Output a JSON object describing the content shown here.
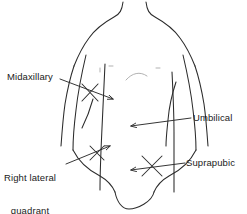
{
  "figure": {
    "background_color": "#ffffff",
    "line_color": "#2b2b2b",
    "faint_line_color": "#9a9a9a"
  },
  "labels": {
    "midaxillary": "Midaxillary",
    "right_lateral_quadrant_line1": "Right lateral",
    "right_lateral_quadrant_line2": "quadrant",
    "umbilical": "Umbilical",
    "suprapubic": "Suprapubic"
  },
  "annotations": [
    {
      "name": "midaxillary",
      "label": "Midaxillary",
      "side": "left",
      "arrow_direction": "right",
      "target": "left mid-axillary line on flank"
    },
    {
      "name": "right-lateral-quadrant",
      "label": "Right lateral quadrant",
      "side": "left",
      "arrow_direction": "up-right",
      "target": "right lower abdominal quadrant"
    },
    {
      "name": "umbilical",
      "label": "Umbilical",
      "side": "right",
      "arrow_direction": "left",
      "target": "umbilicus at abdominal midline"
    },
    {
      "name": "suprapubic",
      "label": "Suprapubic",
      "side": "right",
      "arrow_direction": "down-left",
      "target": "suprapubic region above pubis"
    }
  ]
}
